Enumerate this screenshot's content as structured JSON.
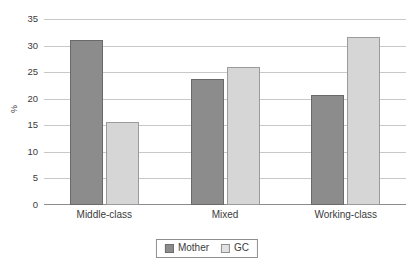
{
  "chart_data": {
    "type": "bar",
    "title": "",
    "xlabel": "",
    "ylabel": "%",
    "categories": [
      "Middle-class",
      "Mixed",
      "Working-class"
    ],
    "series": [
      {
        "name": "Mother",
        "color": "#8c8c8c",
        "values": [
          31.1,
          23.8,
          20.7
        ]
      },
      {
        "name": "GC",
        "color": "#d6d6d6",
        "values": [
          15.6,
          26.0,
          31.7
        ]
      }
    ],
    "ylim": [
      0,
      35
    ],
    "y_ticks": [
      0,
      5,
      10,
      15,
      20,
      25,
      30,
      35
    ],
    "y_tick_labels": [
      "0",
      "5",
      "10",
      "15",
      "20",
      "25",
      "30",
      "35"
    ],
    "grid": true,
    "grid_axis": "y",
    "legend_position": "bottom-center",
    "legend_entries": [
      "Mother",
      "GC"
    ],
    "annotations": []
  }
}
